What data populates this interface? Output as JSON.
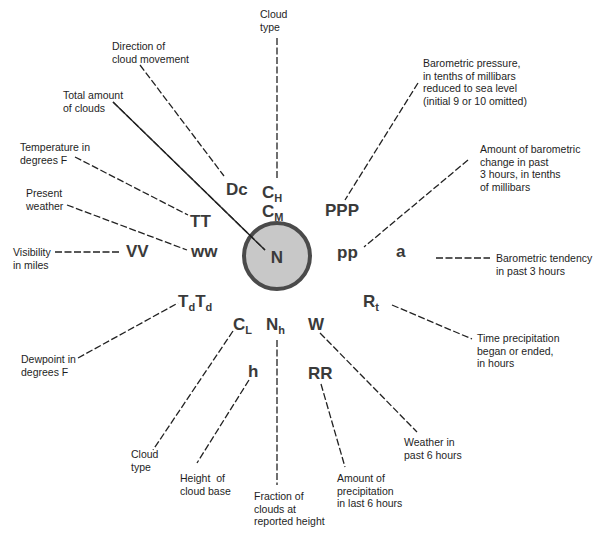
{
  "diagram": {
    "center": {
      "x": 277,
      "y": 256,
      "r": 33,
      "fill": "#c8c8c8",
      "stroke": "#4a4a4a",
      "symbol": "N"
    },
    "leaders": [
      {
        "id": "cloud-type-high",
        "x1": 277,
        "y1": 38,
        "x2": 277,
        "y2": 180
      },
      {
        "id": "direction",
        "x1": 140,
        "y1": 65,
        "x2": 224,
        "y2": 176
      },
      {
        "id": "total-clouds",
        "x1": 113,
        "y1": 102,
        "x2": 265,
        "y2": 250
      },
      {
        "id": "temperature",
        "x1": 75,
        "y1": 157,
        "x2": 188,
        "y2": 215
      },
      {
        "id": "present-weather",
        "x1": 67,
        "y1": 205,
        "x2": 187,
        "y2": 250
      },
      {
        "id": "visibility",
        "x1": 55,
        "y1": 252,
        "x2": 120,
        "y2": 252
      },
      {
        "id": "pressure",
        "x1": 418,
        "y1": 83,
        "x2": 345,
        "y2": 200
      },
      {
        "id": "pressure-change",
        "x1": 468,
        "y1": 160,
        "x2": 364,
        "y2": 247
      },
      {
        "id": "tendency",
        "x1": 436,
        "y1": 258,
        "x2": 490,
        "y2": 258
      },
      {
        "id": "precip-time",
        "x1": 392,
        "y1": 305,
        "x2": 472,
        "y2": 339
      },
      {
        "id": "dewpoint",
        "x1": 78,
        "y1": 358,
        "x2": 178,
        "y2": 303
      },
      {
        "id": "cloud-type-low",
        "x1": 233,
        "y1": 331,
        "x2": 153,
        "y2": 450
      },
      {
        "id": "cloud-base",
        "x1": 249,
        "y1": 380,
        "x2": 197,
        "y2": 463
      },
      {
        "id": "fraction",
        "x1": 277,
        "y1": 340,
        "x2": 277,
        "y2": 485
      },
      {
        "id": "precip-amount",
        "x1": 321,
        "y1": 384,
        "x2": 345,
        "y2": 467
      },
      {
        "id": "past-weather",
        "x1": 320,
        "y1": 333,
        "x2": 417,
        "y2": 432
      }
    ],
    "symbols": [
      {
        "id": "dc",
        "text": "Dc",
        "x": 226,
        "y": 181
      },
      {
        "id": "ch",
        "text": "C",
        "sub": "H",
        "x": 262,
        "y": 184
      },
      {
        "id": "cm",
        "text": "C",
        "sub": "M",
        "x": 262,
        "y": 203
      },
      {
        "id": "ppp",
        "text": "PPP",
        "x": 325,
        "y": 202
      },
      {
        "id": "tt",
        "text": "TT",
        "x": 190,
        "y": 213
      },
      {
        "id": "ww",
        "text": "ww",
        "x": 191,
        "y": 243
      },
      {
        "id": "vv",
        "text": "VV",
        "x": 126,
        "y": 243
      },
      {
        "id": "pp",
        "text": "pp",
        "x": 337,
        "y": 244
      },
      {
        "id": "a",
        "text": "a",
        "x": 396,
        "y": 243
      },
      {
        "id": "rt",
        "text": "R",
        "sub": "t",
        "x": 363,
        "y": 293
      },
      {
        "id": "tdtd",
        "text": "T",
        "sub": "d",
        "text2": "T",
        "sub2": "d",
        "x": 178,
        "y": 293
      },
      {
        "id": "cl",
        "text": "C",
        "sub": "L",
        "x": 233,
        "y": 316
      },
      {
        "id": "nh",
        "text": "N",
        "sub": "h",
        "x": 266,
        "y": 316
      },
      {
        "id": "w",
        "text": "W",
        "x": 308,
        "y": 316
      },
      {
        "id": "h",
        "text": "h",
        "x": 248,
        "y": 363
      },
      {
        "id": "rr",
        "text": "RR",
        "x": 308,
        "y": 365
      }
    ],
    "labels": [
      {
        "id": "cloud-type-high",
        "text": "Cloud\ntype",
        "x": 260,
        "y": 8
      },
      {
        "id": "direction",
        "text": "Direction of\ncloud movement",
        "x": 112,
        "y": 40
      },
      {
        "id": "total-clouds",
        "text": "Total amount\nof clouds",
        "x": 63,
        "y": 89
      },
      {
        "id": "temperature",
        "text": "Temperature in\ndegrees F",
        "x": 20,
        "y": 141
      },
      {
        "id": "present-weather",
        "text": "Present\nweather",
        "x": 26,
        "y": 187
      },
      {
        "id": "visibility",
        "text": "Visibility\nin miles",
        "x": 13,
        "y": 246
      },
      {
        "id": "pressure",
        "text": "Barometric pressure,\nin tenths of millibars\nreduced to sea level\n(initial 9 or 10 omitted)",
        "x": 423,
        "y": 57
      },
      {
        "id": "pressure-change",
        "text": "Amount of barometric\nchange in past\n3 hours, in tenths\nof millibars",
        "x": 480,
        "y": 143
      },
      {
        "id": "tendency",
        "text": "Barometric tendency\nin past 3 hours",
        "x": 496,
        "y": 252
      },
      {
        "id": "precip-time",
        "text": "Time precipitation\nbegan or ended,\nin hours",
        "x": 477,
        "y": 332
      },
      {
        "id": "dewpoint",
        "text": "Dewpoint in\ndegrees F",
        "x": 21,
        "y": 353
      },
      {
        "id": "cloud-type-low",
        "text": "Cloud\ntype",
        "x": 131,
        "y": 448
      },
      {
        "id": "cloud-base",
        "text": "Height  of\ncloud base",
        "x": 180,
        "y": 472
      },
      {
        "id": "fraction",
        "text": "Fraction of\nclouds at\nreported height",
        "x": 254,
        "y": 490
      },
      {
        "id": "precip-amount",
        "text": "Amount of\nprecipitation\nin last 6 hours",
        "x": 337,
        "y": 472
      },
      {
        "id": "past-weather",
        "text": "Weather in\npast 6 hours",
        "x": 404,
        "y": 436
      }
    ]
  }
}
